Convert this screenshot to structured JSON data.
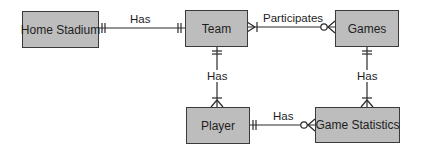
{
  "entities": {
    "home_stadium": "Home Stadium",
    "team": "Team",
    "games": "Games",
    "player": "Player",
    "game_statistics": "Game Statistics"
  },
  "relationships": [
    {
      "from": "Home Stadium",
      "to": "Team",
      "label": "Has",
      "from_cardinality": "one-and-only-one",
      "to_cardinality": "one-and-only-one"
    },
    {
      "from": "Team",
      "to": "Games",
      "label": "Participates",
      "from_cardinality": "one-or-many",
      "to_cardinality": "zero-or-many"
    },
    {
      "from": "Team",
      "to": "Player",
      "label": "Has",
      "from_cardinality": "one-and-only-one",
      "to_cardinality": "one-or-many"
    },
    {
      "from": "Games",
      "to": "Game Statistics",
      "label": "Has",
      "from_cardinality": "one-and-only-one",
      "to_cardinality": "one-or-many"
    },
    {
      "from": "Player",
      "to": "Game Statistics",
      "label": "Has",
      "from_cardinality": "one-and-only-one",
      "to_cardinality": "zero-or-many"
    }
  ],
  "colors": {
    "entity_fill": "#bdbdbd",
    "line": "#2a2a2a"
  }
}
